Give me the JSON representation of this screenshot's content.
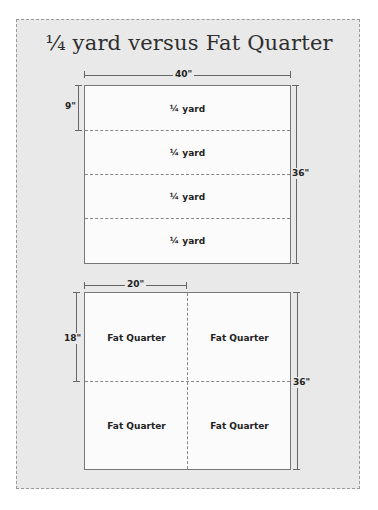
{
  "title": "¼ yard versus Fat Quarter",
  "top_diagram": {
    "width_label": "40\"",
    "height_label": "36\"",
    "row_height_label": "9\"",
    "rows": [
      {
        "label": "¼ yard"
      },
      {
        "label": "¼ yard"
      },
      {
        "label": "¼ yard"
      },
      {
        "label": "¼ yard"
      }
    ]
  },
  "bottom_diagram": {
    "width_label": "20\"",
    "height_label": "18\"",
    "total_height_label": "36\"",
    "cells": [
      {
        "label": "Fat Quarter"
      },
      {
        "label": "Fat Quarter"
      },
      {
        "label": "Fat Quarter"
      },
      {
        "label": "Fat Quarter"
      }
    ]
  },
  "colors": {
    "background": "#e9e9e9",
    "fabric": "#fbfbfb",
    "line": "#666666",
    "text": "#222222"
  }
}
